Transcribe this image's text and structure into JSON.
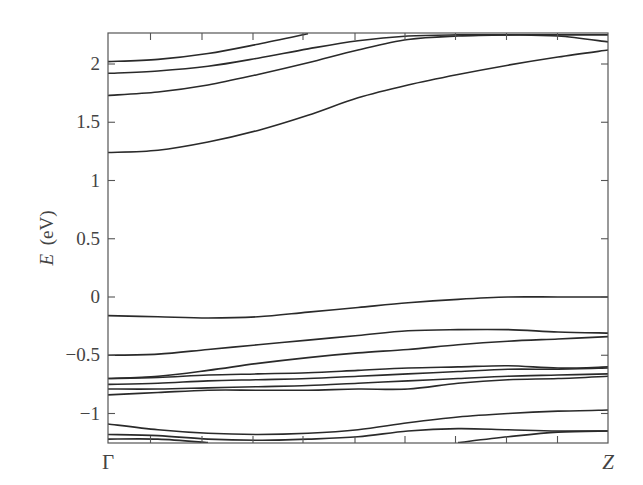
{
  "chart_data": {
    "type": "line",
    "title": "",
    "xlabel": "",
    "ylabel": "E (eV)",
    "ylabel_italic_symbol": "E",
    "ylabel_unit": "(eV)",
    "xlim": [
      0,
      1
    ],
    "ylim": [
      -1.25,
      2.27
    ],
    "x_ticks": [
      {
        "pos": 0,
        "label": "Γ"
      },
      {
        "pos": 1,
        "label": "Z"
      }
    ],
    "x_minor_ticks": [
      0.085,
      0.188,
      0.29,
      0.39,
      0.494,
      0.594,
      0.695,
      0.797,
      0.899
    ],
    "y_ticks": [
      -1,
      -0.5,
      0,
      0.5,
      1,
      1.5,
      2
    ],
    "y_tick_labels": [
      "−1",
      "−0.5",
      "0",
      "0.5",
      "1",
      "1.5",
      "2"
    ],
    "grid": false,
    "legend": null,
    "x": [
      0,
      0.1,
      0.2,
      0.3,
      0.4,
      0.5,
      0.6,
      0.7,
      0.8,
      0.9,
      1.0
    ],
    "series": [
      {
        "name": "conduction-1",
        "values": [
          1.24,
          1.26,
          1.33,
          1.43,
          1.56,
          1.71,
          1.82,
          1.91,
          1.99,
          2.06,
          2.12
        ]
      },
      {
        "name": "conduction-2",
        "values": [
          1.73,
          1.76,
          1.82,
          1.91,
          2.01,
          2.12,
          2.21,
          2.24,
          2.25,
          2.25,
          2.25
        ]
      },
      {
        "name": "conduction-3",
        "values": [
          1.92,
          1.94,
          1.98,
          2.05,
          2.13,
          2.2,
          2.24,
          2.25,
          2.25,
          2.24,
          2.19
        ]
      },
      {
        "name": "conduction-4",
        "values": [
          2.02,
          2.04,
          2.09,
          2.17,
          2.26,
          null,
          null,
          null,
          null,
          null,
          null
        ]
      },
      {
        "name": "valence-1",
        "values": [
          -0.16,
          -0.17,
          -0.18,
          -0.17,
          -0.13,
          -0.09,
          -0.05,
          -0.02,
          0.0,
          0.0,
          0.0
        ]
      },
      {
        "name": "valence-2",
        "values": [
          -0.5,
          -0.49,
          -0.45,
          -0.41,
          -0.37,
          -0.33,
          -0.29,
          -0.28,
          -0.28,
          -0.3,
          -0.31
        ]
      },
      {
        "name": "valence-3",
        "values": [
          -0.7,
          -0.68,
          -0.63,
          -0.57,
          -0.52,
          -0.48,
          -0.45,
          -0.41,
          -0.38,
          -0.36,
          -0.34
        ]
      },
      {
        "name": "valence-4",
        "values": [
          -0.7,
          -0.69,
          -0.67,
          -0.66,
          -0.65,
          -0.63,
          -0.61,
          -0.6,
          -0.59,
          -0.61,
          -0.6
        ]
      },
      {
        "name": "valence-5",
        "values": [
          -0.75,
          -0.74,
          -0.72,
          -0.71,
          -0.7,
          -0.68,
          -0.66,
          -0.64,
          -0.62,
          -0.62,
          -0.61
        ]
      },
      {
        "name": "valence-6",
        "values": [
          -0.79,
          -0.79,
          -0.78,
          -0.77,
          -0.76,
          -0.74,
          -0.72,
          -0.7,
          -0.68,
          -0.67,
          -0.66
        ]
      },
      {
        "name": "valence-7",
        "values": [
          -0.84,
          -0.82,
          -0.8,
          -0.8,
          -0.8,
          -0.79,
          -0.79,
          -0.74,
          -0.71,
          -0.7,
          -0.68
        ]
      },
      {
        "name": "valence-8",
        "values": [
          -1.09,
          -1.14,
          -1.17,
          -1.18,
          -1.17,
          -1.14,
          -1.08,
          -1.03,
          -1.0,
          -0.98,
          -0.97
        ]
      },
      {
        "name": "valence-9",
        "values": [
          -1.18,
          -1.19,
          -1.22,
          -1.23,
          -1.22,
          -1.2,
          -1.15,
          -1.13,
          -1.14,
          -1.15,
          -1.15
        ]
      },
      {
        "name": "valence-10",
        "values": [
          -1.22,
          -1.22,
          -1.25,
          null,
          null,
          null,
          null,
          -1.25,
          -1.2,
          -1.16,
          -1.15
        ]
      }
    ]
  }
}
